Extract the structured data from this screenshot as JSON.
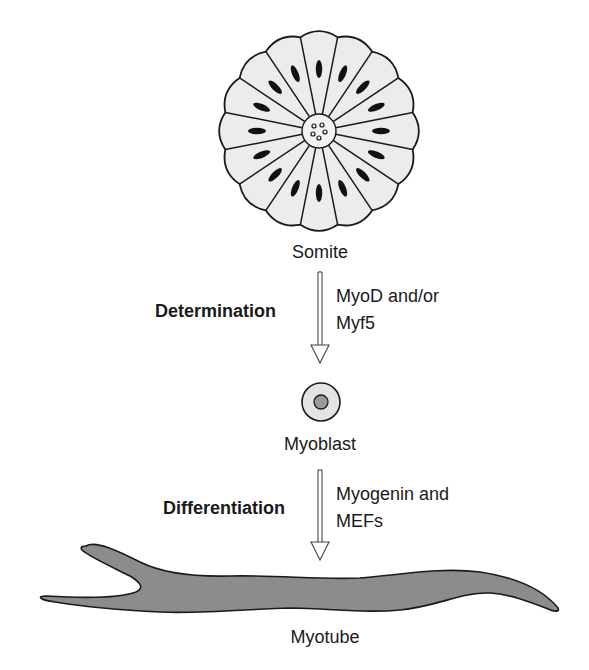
{
  "diagram": {
    "stages": [
      {
        "id": "somite",
        "label": "Somite"
      },
      {
        "id": "myoblast",
        "label": "Myoblast"
      },
      {
        "id": "myotube",
        "label": "Myotube"
      }
    ],
    "steps": [
      {
        "process": "Determination",
        "factors_line1": "MyoD and/or",
        "factors_line2": "Myf5"
      },
      {
        "process": "Differentiation",
        "factors_line1": "Myogenin and",
        "factors_line2": "MEFs"
      }
    ],
    "colors": {
      "outline": "#1a1a1a",
      "cell_fill": "#ececec",
      "nucleus_fill": "#111111",
      "myoblast_fill": "#e4e4e4",
      "myoblast_nucleus": "#9a9a9a",
      "myotube_fill": "#8c8c8c"
    },
    "somite_segments": 16
  }
}
